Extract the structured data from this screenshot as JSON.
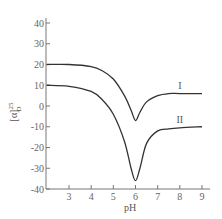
{
  "chart_data": {
    "type": "line",
    "title": "",
    "xlabel": "pH",
    "ylabel": "[α]D25",
    "xlim": [
      2.0,
      9.4
    ],
    "ylim": [
      -40,
      40
    ],
    "xticks": [
      3,
      4,
      5,
      6,
      7,
      8,
      9
    ],
    "yticks": [
      40,
      30,
      20,
      10,
      0,
      -10,
      -20,
      -30,
      -40
    ],
    "grid": false,
    "legend": "inline labels",
    "series": [
      {
        "name": "I",
        "x": [
          2.0,
          3.0,
          4.0,
          4.5,
          5.0,
          5.5,
          5.8,
          6.0,
          6.2,
          6.5,
          7.0,
          7.5,
          8.0,
          9.0
        ],
        "values": [
          20,
          20,
          19,
          17,
          13,
          5,
          -2,
          -7,
          -3,
          2,
          5,
          6,
          6,
          6
        ]
      },
      {
        "name": "II",
        "x": [
          2.0,
          3.0,
          4.0,
          4.5,
          5.0,
          5.5,
          5.8,
          6.0,
          6.2,
          6.5,
          7.0,
          7.5,
          8.0,
          9.0
        ],
        "values": [
          10,
          9.5,
          7,
          3,
          -4,
          -17,
          -30,
          -36,
          -30,
          -18,
          -12,
          -11,
          -10.5,
          -10
        ]
      }
    ],
    "annotations": [
      {
        "text": "I",
        "x": 8.0,
        "y": 7
      },
      {
        "text": "II",
        "x": 8.0,
        "y": -9
      }
    ]
  },
  "labels": {
    "xlabel": "pH",
    "ylabel_main": "[α]",
    "ylabel_sup": "25",
    "ylabel_sub": "D",
    "series_I": "I",
    "series_II": "II"
  }
}
